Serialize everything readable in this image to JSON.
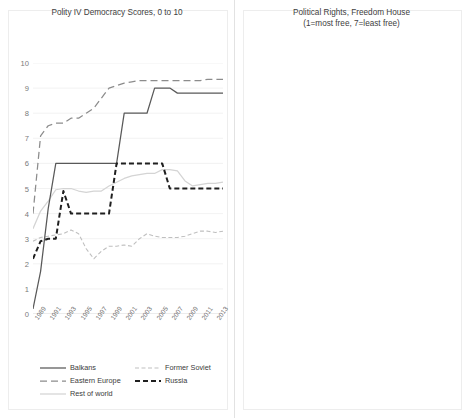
{
  "figure": {
    "background": "#ffffff",
    "panel_border": "#ededed"
  },
  "series_styles": {
    "balkans": {
      "color": "#595959",
      "width": 1.25,
      "dash": "none"
    },
    "eastern_europe": {
      "color": "#8c8c8c",
      "width": 1.25,
      "dash": "7 4"
    },
    "rest_of_world": {
      "color": "#d4d4d4",
      "width": 1.25,
      "dash": "none"
    },
    "former_soviet": {
      "color": "#bfbfbf",
      "width": 1.1,
      "dash": "4 2.5"
    },
    "russia": {
      "color": "#1f1f1f",
      "width": 2.0,
      "dash": "5 3"
    }
  },
  "left_panel": {
    "title": "Polity IV Democracy Scores, 0 to 10",
    "legend": {
      "items": [
        {
          "label": "Balkans",
          "key": "balkans"
        },
        {
          "label": "Former Soviet",
          "key": "former_soviet"
        },
        {
          "label": "Eastern Europe",
          "key": "eastern_europe"
        },
        {
          "label": "Russia",
          "key": "russia"
        },
        {
          "label": "Rest of world",
          "key": "rest_of_world"
        }
      ]
    }
  },
  "right_panel": {
    "title_line1": "Political Rights, Freedom House",
    "title_line2": "(1=most free, 7=least free)",
    "legend": {
      "items": [
        {
          "label": "Balkans",
          "key": "balkans"
        },
        {
          "label": "Fomer Soviet",
          "key": "former_soviet"
        },
        {
          "label": "Eastern Europe",
          "key": "eastern_europe"
        },
        {
          "label": "Russia",
          "key": "russia"
        },
        {
          "label": "Rest of world",
          "key": "rest_of_world"
        }
      ]
    }
  },
  "chart_data": [
    {
      "type": "line",
      "id": "polity",
      "title": "Polity IV Democracy Scores, 0 to 10",
      "xlabel": "",
      "ylabel": "",
      "ylim": [
        0,
        10
      ],
      "yticks": [
        0,
        1,
        2,
        3,
        4,
        5,
        6,
        7,
        8,
        9,
        10
      ],
      "xlim": [
        1989,
        2014
      ],
      "x": [
        1989,
        1990,
        1991,
        1992,
        1993,
        1994,
        1995,
        1996,
        1997,
        1998,
        1999,
        2000,
        2001,
        2002,
        2003,
        2004,
        2005,
        2006,
        2007,
        2008,
        2009,
        2010,
        2011,
        2012,
        2013,
        2014
      ],
      "xticks": [
        1989,
        1991,
        1993,
        1995,
        1997,
        1999,
        2001,
        2003,
        2005,
        2007,
        2009,
        2011,
        2013
      ],
      "grid": "horizontal",
      "legend_position": "bottom",
      "series": [
        {
          "name": "Balkans",
          "key": "balkans",
          "values": [
            0.2,
            1.7,
            4.2,
            6,
            6,
            6,
            6,
            6,
            6,
            6,
            6,
            6,
            8,
            8,
            8,
            8,
            9,
            9,
            9,
            8.8,
            8.8,
            8.8,
            8.8,
            8.8,
            8.8,
            8.8
          ]
        },
        {
          "name": "Eastern Europe",
          "key": "eastern_europe",
          "values": [
            4,
            7.1,
            7.5,
            7.6,
            7.6,
            7.8,
            7.8,
            8,
            8.2,
            8.6,
            9,
            9.1,
            9.2,
            9.25,
            9.3,
            9.3,
            9.3,
            9.3,
            9.3,
            9.3,
            9.3,
            9.3,
            9.3,
            9.35,
            9.35,
            9.35
          ]
        },
        {
          "name": "Russia",
          "key": "russia",
          "values": [
            2.2,
            2.9,
            3,
            3,
            4.9,
            4,
            4,
            4,
            4,
            4,
            4,
            6,
            6,
            6,
            6,
            6,
            6,
            6,
            5,
            5,
            5,
            5,
            5,
            5,
            5,
            5
          ]
        },
        {
          "name": "Former Soviet",
          "key": "former_soviet",
          "values": [
            2.9,
            3.05,
            3.1,
            3.15,
            3.2,
            3.35,
            3.2,
            2.6,
            2.2,
            2.5,
            2.7,
            2.7,
            2.75,
            2.7,
            3.0,
            3.2,
            3.1,
            3.05,
            3.05,
            3.05,
            3.1,
            3.2,
            3.3,
            3.3,
            3.25,
            3.3
          ]
        },
        {
          "name": "Rest of world",
          "key": "rest_of_world",
          "values": [
            3.4,
            4.1,
            4.5,
            4.95,
            5.0,
            5.0,
            4.9,
            4.85,
            4.9,
            4.9,
            5.1,
            5.25,
            5.4,
            5.5,
            5.55,
            5.6,
            5.6,
            5.75,
            5.75,
            5.7,
            5.3,
            5.1,
            5.15,
            5.2,
            5.2,
            5.25
          ]
        }
      ]
    },
    {
      "type": "line",
      "id": "freedom-house",
      "title": "Political Rights, Freedom House (1=most free, 7=least free)",
      "xlabel": "",
      "ylabel": "",
      "ylim": [
        0,
        8
      ],
      "yticks": [
        0,
        1,
        2,
        3,
        4,
        5,
        6,
        7,
        8
      ],
      "xlim": [
        1989,
        2015
      ],
      "x": [
        1989,
        1990,
        1991,
        1992,
        1993,
        1994,
        1995,
        1996,
        1997,
        1998,
        1999,
        2000,
        2001,
        2002,
        2003,
        2004,
        2005,
        2006,
        2007,
        2008,
        2009,
        2010,
        2011,
        2012,
        2013,
        2014,
        2015
      ],
      "xticks": [
        1989,
        1991,
        1993,
        1995,
        1997,
        1999,
        2001,
        2003,
        2005,
        2007,
        2009,
        2011,
        2013,
        2015
      ],
      "grid": "horizontal",
      "legend_position": "bottom",
      "series": [
        {
          "name": "Balkans",
          "key": "balkans",
          "values": [
            7,
            7,
            5.9,
            4.0,
            5.3,
            4.4,
            5.3,
            5.2,
            5.2,
            5.2,
            5.2,
            4.6,
            3.6,
            3.2,
            3.05,
            3.0,
            3.0,
            3.05,
            2.75,
            2.9,
            3.0,
            3.0,
            2.95,
            3.0,
            2.9,
            2.95,
            3.0
          ]
        },
        {
          "name": "Eastern Europe",
          "key": "eastern_europe",
          "values": [
            6.6,
            5.3,
            3.9,
            3.1,
            2.3,
            1.9,
            1.6,
            1.4,
            1.35,
            1.3,
            1.3,
            1.3,
            1.3,
            1.35,
            1.3,
            1.3,
            1.3,
            1.3,
            1.3,
            1.3,
            1.35,
            1.35,
            1.4,
            1.4,
            1.4,
            1.4,
            1.4
          ]
        },
        {
          "name": "Russia",
          "key": "russia",
          "values": [
            3,
            3,
            3,
            3,
            3,
            3,
            3,
            3,
            3.6,
            4,
            4,
            4,
            4.6,
            5,
            6,
            6,
            6,
            6,
            6,
            6,
            6,
            6,
            6,
            6,
            6,
            6,
            6
          ]
        },
        {
          "name": "Fomer Soviet",
          "key": "former_soviet",
          "values": [
            7,
            7,
            5.3,
            5.0,
            5.2,
            5.25,
            5.2,
            5.25,
            5.25,
            5.25,
            5.3,
            5.3,
            5.45,
            5.5,
            5.5,
            5.45,
            5.4,
            5.3,
            5.45,
            5.5,
            5.55,
            5.6,
            5.6,
            5.55,
            5.45,
            5.5,
            5.5
          ]
        },
        {
          "name": "Rest of world",
          "key": "rest_of_world",
          "values": [
            4.3,
            4.25,
            4.2,
            4.1,
            4.05,
            4.0,
            3.95,
            3.9,
            3.85,
            3.8,
            3.7,
            3.6,
            3.5,
            3.4,
            3.3,
            3.25,
            3.2,
            3.2,
            3.2,
            3.2,
            3.2,
            3.2,
            3.2,
            3.2,
            3.2,
            3.2,
            3.2
          ]
        }
      ]
    }
  ]
}
